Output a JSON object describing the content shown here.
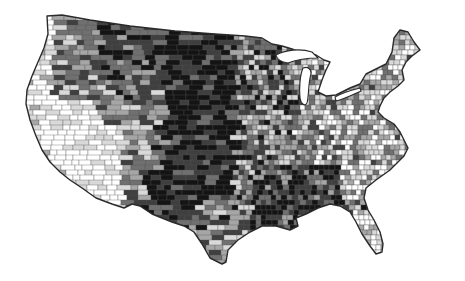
{
  "map": {
    "type": "choropleth",
    "subject": "Contiguous United States by county",
    "color_scale": "grayscale",
    "palette": [
      "#ffffff",
      "#d9d9d9",
      "#a6a6a6",
      "#707070",
      "#3f3f3f",
      "#141414"
    ],
    "border_color": "#2a2a2a",
    "background": "#ffffff",
    "title": "",
    "legend": null,
    "labels": []
  },
  "chart_data": {
    "type": "heatmap",
    "title": "",
    "xlabel": "",
    "ylabel": "",
    "legend": null,
    "regions": [
      {
        "name": "Pacific Coast (WA/OR/CA coast)",
        "shade_level": 0.1
      },
      {
        "name": "Southwest desert (CA/NV/AZ)",
        "shade_level": 0.05
      },
      {
        "name": "Intermountain West (ID/UT/WY/CO)",
        "shade_level": 0.55
      },
      {
        "name": "Northern Rockies (MT)",
        "shade_level": 0.7
      },
      {
        "name": "Northern Plains (ND/SD/NE)",
        "shade_level": 0.92
      },
      {
        "name": "Southern Plains (KS/OK/west TX)",
        "shade_level": 0.88
      },
      {
        "name": "Texas Gulf / central TX",
        "shade_level": 0.6
      },
      {
        "name": "Upper Midwest (MN/WI/IA)",
        "shade_level": 0.55
      },
      {
        "name": "Great Lakes (MI/OH/IN/IL)",
        "shade_level": 0.35
      },
      {
        "name": "Northeast / New England",
        "shade_level": 0.3
      },
      {
        "name": "Mid-Atlantic / Appalachia",
        "shade_level": 0.45
      },
      {
        "name": "Carolinas / Virginia piedmont",
        "shade_level": 0.2
      },
      {
        "name": "Deep South / Mississippi Delta",
        "shade_level": 0.8
      },
      {
        "name": "Florida",
        "shade_level": 0.1
      }
    ]
  }
}
